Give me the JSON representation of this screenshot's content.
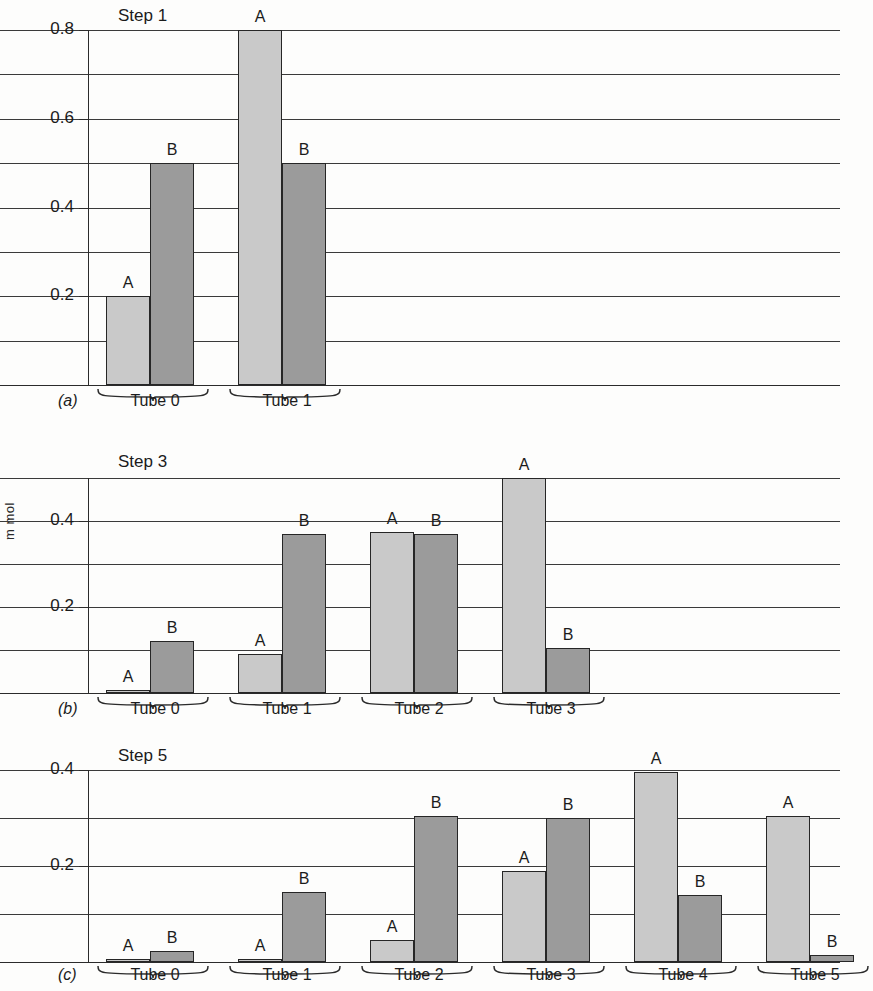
{
  "figure": {
    "axis_title": "m mol",
    "series_labels": {
      "a": "A",
      "b": "B"
    },
    "colors": {
      "series_a": "#c9c9c9",
      "series_b": "#9b9b9b",
      "outline": "#262626",
      "grid": "#3a3a3a"
    }
  },
  "panels": [
    {
      "letter": "(a)",
      "title": "Step 1",
      "ylim": [
        0,
        0.8
      ],
      "ticks": [
        "0.2",
        "0.4",
        "0.6",
        "0.8"
      ],
      "tick_values": [
        0.2,
        0.4,
        0.6,
        0.8
      ],
      "gridlines": [
        0.1,
        0.2,
        0.3,
        0.4,
        0.5,
        0.6,
        0.7,
        0.8
      ],
      "tubes": [
        {
          "label": "Tube 0",
          "a": 0.2,
          "b": 0.5
        },
        {
          "label": "Tube 1",
          "a": 0.8,
          "b": 0.5
        }
      ]
    },
    {
      "letter": "(b)",
      "title": "Step 3",
      "ylim": [
        0,
        0.5
      ],
      "ticks": [
        "0.2",
        "0.4"
      ],
      "tick_values": [
        0.2,
        0.4
      ],
      "gridlines": [
        0.1,
        0.2,
        0.3,
        0.4,
        0.5
      ],
      "tubes": [
        {
          "label": "Tube 0",
          "a": 0.005,
          "b": 0.12
        },
        {
          "label": "Tube 1",
          "a": 0.09,
          "b": 0.37
        },
        {
          "label": "Tube 2",
          "a": 0.375,
          "b": 0.37
        },
        {
          "label": "Tube 3",
          "a": 0.5,
          "b": 0.105
        }
      ]
    },
    {
      "letter": "(c)",
      "title": "Step 5",
      "ylim": [
        0,
        0.4
      ],
      "ticks": [
        "0.2",
        "0.4"
      ],
      "tick_values": [
        0.2,
        0.4
      ],
      "gridlines": [
        0.1,
        0.2,
        0.3,
        0.4
      ],
      "tubes": [
        {
          "label": "Tube 0",
          "a": 0.005,
          "b": 0.022
        },
        {
          "label": "Tube 1",
          "a": 0.007,
          "b": 0.145
        },
        {
          "label": "Tube 2",
          "a": 0.045,
          "b": 0.305
        },
        {
          "label": "Tube 3",
          "a": 0.19,
          "b": 0.3
        },
        {
          "label": "Tube 4",
          "a": 0.395,
          "b": 0.14
        },
        {
          "label": "Tube 5",
          "a": 0.305,
          "b": 0.015
        }
      ]
    }
  ],
  "chart_data": {
    "type": "bar",
    "xlabel": "",
    "ylabel": "m mol",
    "series": [
      {
        "name": "A",
        "color": "#c9c9c9"
      },
      {
        "name": "B",
        "color": "#9b9b9b"
      }
    ],
    "panels": [
      {
        "panel": "(a)",
        "title": "Step 1",
        "ylim": [
          0,
          0.8
        ],
        "ytick_labels": [
          "0.2",
          "0.4",
          "0.6",
          "0.8"
        ],
        "gridline_interval": 0.1,
        "categories": [
          "Tube 0",
          "Tube 1"
        ],
        "series": [
          {
            "name": "A",
            "values": [
              0.2,
              0.8
            ]
          },
          {
            "name": "B",
            "values": [
              0.5,
              0.5
            ]
          }
        ]
      },
      {
        "panel": "(b)",
        "title": "Step 3",
        "ylim": [
          0,
          0.5
        ],
        "ytick_labels": [
          "0.2",
          "0.4"
        ],
        "gridline_interval": 0.1,
        "categories": [
          "Tube 0",
          "Tube 1",
          "Tube 2",
          "Tube 3"
        ],
        "series": [
          {
            "name": "A",
            "values": [
              0.005,
              0.09,
              0.375,
              0.5
            ]
          },
          {
            "name": "B",
            "values": [
              0.12,
              0.37,
              0.37,
              0.105
            ]
          }
        ]
      },
      {
        "panel": "(c)",
        "title": "Step 5",
        "ylim": [
          0,
          0.4
        ],
        "ytick_labels": [
          "0.2",
          "0.4"
        ],
        "gridline_interval": 0.1,
        "categories": [
          "Tube 0",
          "Tube 1",
          "Tube 2",
          "Tube 3",
          "Tube 4",
          "Tube 5"
        ],
        "series": [
          {
            "name": "A",
            "values": [
              0.005,
              0.007,
              0.045,
              0.19,
              0.395,
              0.305
            ]
          },
          {
            "name": "B",
            "values": [
              0.022,
              0.145,
              0.305,
              0.3,
              0.14,
              0.015
            ]
          }
        ]
      }
    ]
  }
}
